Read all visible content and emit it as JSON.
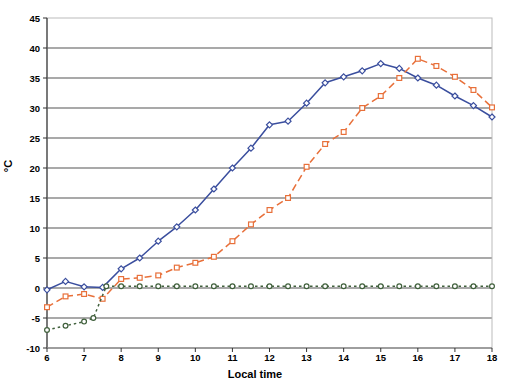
{
  "chart_data": {
    "type": "line",
    "title": "",
    "xlabel": "Local time",
    "ylabel": "°C",
    "xlim": [
      6,
      18
    ],
    "ylim": [
      -10,
      45
    ],
    "ytick_step": 5,
    "xtick_step": 1,
    "grid": "horizontal",
    "legend": "none",
    "yticks": [
      45,
      40,
      35,
      30,
      25,
      20,
      15,
      10,
      5,
      0,
      -5,
      -10
    ],
    "xticks": [
      6,
      7,
      8,
      9,
      10,
      11,
      12,
      13,
      14,
      15,
      16,
      17,
      18
    ],
    "series": [
      {
        "name": "series-blue",
        "color": "#3A4E9E",
        "style": "solid",
        "marker": "diamond",
        "x": [
          6,
          6.5,
          7,
          7.5,
          8,
          8.5,
          9,
          9.5,
          10,
          10.5,
          11,
          11.5,
          12,
          12.5,
          13,
          13.5,
          14,
          14.5,
          15,
          15.5,
          16,
          16.5,
          17,
          17.5,
          18
        ],
        "values": [
          -0.3,
          1.1,
          0.2,
          0.1,
          3.2,
          5.0,
          7.8,
          10.2,
          13.0,
          16.5,
          20.0,
          23.3,
          27.2,
          27.8,
          30.8,
          34.2,
          35.2,
          36.2,
          37.4,
          36.6,
          35.0,
          33.8,
          32.0,
          30.4,
          28.5
        ]
      },
      {
        "name": "series-orange",
        "color": "#E8703A",
        "style": "dashed",
        "marker": "square",
        "x": [
          6,
          6.5,
          7,
          7.5,
          8,
          8.5,
          9,
          9.5,
          10,
          10.5,
          11,
          11.5,
          12,
          12.5,
          13,
          13.5,
          14,
          14.5,
          15,
          15.5,
          16,
          16.5,
          17,
          17.5,
          18
        ],
        "values": [
          -3.2,
          -1.4,
          -1.0,
          -1.8,
          1.5,
          1.7,
          2.1,
          3.4,
          4.2,
          5.2,
          7.8,
          10.6,
          13.0,
          15.0,
          20.2,
          24.0,
          26.0,
          30.0,
          32.0,
          35.0,
          38.2,
          37.0,
          35.2,
          33.0,
          30.1
        ]
      },
      {
        "name": "series-green",
        "color": "#40603C",
        "style": "dotted",
        "marker": "circle",
        "x": [
          6,
          6.5,
          7,
          7.25,
          7.6,
          8,
          8.5,
          9,
          9.5,
          10,
          10.5,
          11,
          11.5,
          12,
          12.5,
          13,
          13.5,
          14,
          14.5,
          15,
          15.5,
          16,
          16.5,
          17,
          17.5,
          18
        ],
        "values": [
          -7.0,
          -6.3,
          -5.6,
          -5.0,
          0.3,
          0.3,
          0.3,
          0.3,
          0.3,
          0.3,
          0.3,
          0.3,
          0.3,
          0.3,
          0.3,
          0.3,
          0.3,
          0.3,
          0.3,
          0.3,
          0.3,
          0.3,
          0.3,
          0.3,
          0.3,
          0.3
        ]
      }
    ]
  },
  "plot_area": {
    "left": 47,
    "top": 18,
    "right": 492,
    "bottom": 348
  },
  "colors": {
    "grid": "#555555",
    "axis": "#888888",
    "text": "#000000",
    "background": "#ffffff"
  }
}
